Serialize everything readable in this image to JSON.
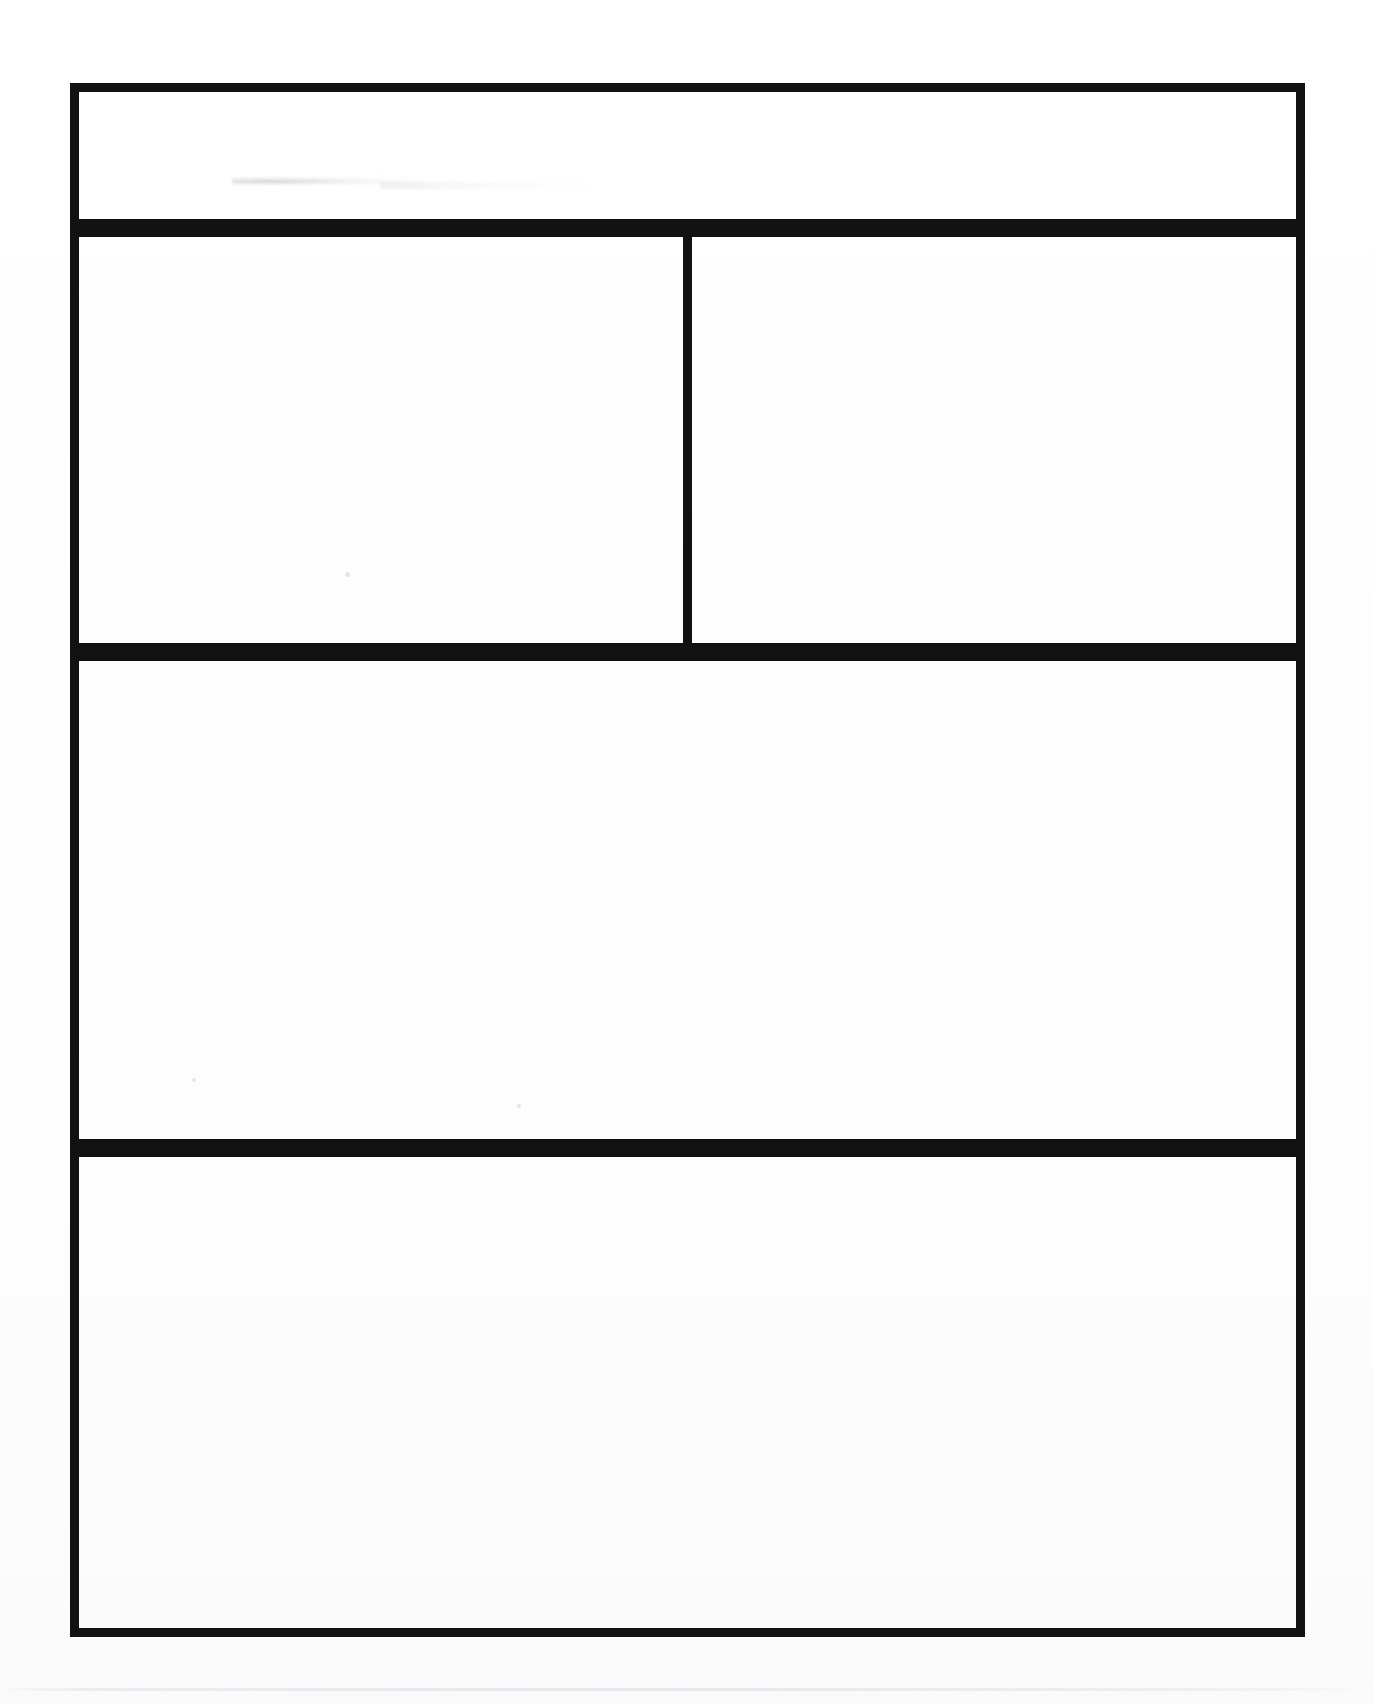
{
  "document": {
    "kind": "scanned-blank-form",
    "page_background": "#fefefe",
    "ink_color": "#121212",
    "border_width_px": 9,
    "visible_text": "",
    "note": ""
  },
  "frame": {
    "left_px": 70,
    "top_px": 83,
    "right_px": 1305,
    "bottom_px": 1637,
    "width_px": 1235,
    "height_px": 1554
  },
  "rows": [
    {
      "id": "row1",
      "label": "",
      "top_px": 83,
      "height_px": 145,
      "cells": [
        {
          "id": "row1-cell",
          "label": "",
          "content": "",
          "width_px": 1235
        }
      ]
    },
    {
      "id": "row2",
      "label": "",
      "top_px": 228,
      "height_px": 424,
      "divider_x_px": 688,
      "cells": [
        {
          "id": "row2-left",
          "label": "",
          "content": "",
          "width_px": 622
        },
        {
          "id": "row2-right",
          "label": "",
          "content": "",
          "width_px": 622
        }
      ]
    },
    {
      "id": "row3",
      "label": "",
      "top_px": 652,
      "height_px": 496,
      "cells": [
        {
          "id": "row3-cell",
          "label": "",
          "content": "",
          "width_px": 1235
        }
      ]
    },
    {
      "id": "row4",
      "label": "",
      "top_px": 1148,
      "height_px": 489,
      "cells": [
        {
          "id": "row4-cell",
          "label": "",
          "content": "",
          "width_px": 1235
        }
      ]
    }
  ],
  "artifacts": [
    {
      "id": "smudge-row1",
      "type": "smudge",
      "x_px": 232,
      "y_px": 176,
      "w_px": 190,
      "h_px": 9
    },
    {
      "id": "smudge-row1-tail",
      "type": "smudge",
      "x_px": 380,
      "y_px": 182,
      "w_px": 230,
      "h_px": 7
    },
    {
      "id": "scanline-bottom",
      "type": "scan-band",
      "x_px": 0,
      "y_px": 1688,
      "w_px": 1374,
      "h_px": 3
    },
    {
      "id": "speck-a",
      "type": "speck",
      "x_px": 345,
      "y_px": 572,
      "w_px": 5,
      "h_px": 5
    },
    {
      "id": "speck-b",
      "type": "speck",
      "x_px": 192,
      "y_px": 1078,
      "w_px": 4,
      "h_px": 4
    },
    {
      "id": "speck-c",
      "type": "speck",
      "x_px": 517,
      "y_px": 1104,
      "w_px": 4,
      "h_px": 4
    }
  ]
}
